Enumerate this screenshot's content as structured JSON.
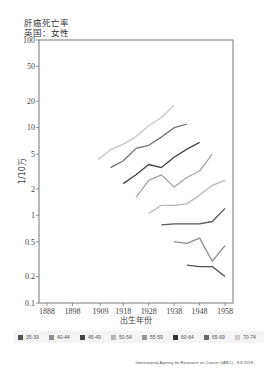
{
  "title": {
    "line1": "肝癌死亡率",
    "line2": "英国：女性"
  },
  "credit": "International Agency for Research on Cancer (IARC) - 9.8.2018",
  "chart_data": {
    "type": "line",
    "title": "肝癌死亡率 英国：女性",
    "xlabel": "出生年份",
    "ylabel": "1/10万",
    "yscale": "log",
    "ylim": [
      0.1,
      100
    ],
    "y_ticks": [
      100,
      50,
      20,
      10,
      5,
      2,
      1,
      0.5,
      0.2,
      0.1
    ],
    "x_ticks": [
      "1888",
      "1898",
      "1909",
      "1918",
      "1928",
      "1938",
      "1948",
      "1958"
    ],
    "legend_position": "bottom",
    "grid": false,
    "series": [
      {
        "name": "70-74",
        "color": "#c8c8c8",
        "x": [
          1908,
          1913,
          1918,
          1923,
          1928,
          1933,
          1938
        ],
        "values": [
          4.3,
          5.6,
          6.5,
          7.9,
          10.5,
          13.0,
          18.0
        ]
      },
      {
        "name": "65-69",
        "color": "#6e6e6e",
        "x": [
          1913,
          1918,
          1923,
          1928,
          1933,
          1938,
          1943
        ],
        "values": [
          3.5,
          4.2,
          5.8,
          6.3,
          7.8,
          10.0,
          11.0
        ]
      },
      {
        "name": "60-64",
        "color": "#444444",
        "x": [
          1918,
          1923,
          1928,
          1933,
          1938,
          1943,
          1948
        ],
        "values": [
          2.3,
          2.9,
          3.8,
          3.5,
          4.6,
          5.7,
          6.8
        ]
      },
      {
        "name": "55-59",
        "color": "#a5a5a5",
        "x": [
          1923,
          1928,
          1933,
          1938,
          1943,
          1948,
          1953
        ],
        "values": [
          1.6,
          2.5,
          2.9,
          2.1,
          2.7,
          3.2,
          5.0
        ]
      },
      {
        "name": "50-54",
        "color": "#b8b8b8",
        "x": [
          1928,
          1933,
          1938,
          1943,
          1948,
          1953,
          1958
        ],
        "values": [
          1.05,
          1.3,
          1.3,
          1.35,
          1.7,
          2.2,
          2.5
        ]
      },
      {
        "name": "45-49",
        "color": "#555555",
        "x": [
          1933,
          1938,
          1943,
          1948,
          1953,
          1958
        ],
        "values": [
          0.78,
          0.8,
          0.8,
          0.8,
          0.85,
          1.2
        ]
      },
      {
        "name": "40-44",
        "color": "#8c8c8c",
        "x": [
          1938,
          1943,
          1948,
          1953,
          1958
        ],
        "values": [
          0.5,
          0.48,
          0.55,
          0.3,
          0.45
        ]
      },
      {
        "name": "35-39",
        "color": "#505050",
        "x": [
          1943,
          1948,
          1953,
          1958
        ],
        "values": [
          0.27,
          0.26,
          0.26,
          0.2
        ]
      }
    ]
  },
  "legend": [
    {
      "label": "35-39",
      "color": "#555555"
    },
    {
      "label": "40-44",
      "color": "#909090"
    },
    {
      "label": "45-49",
      "color": "#444444"
    },
    {
      "label": "50-54",
      "color": "#b5b5b5"
    },
    {
      "label": "55-59",
      "color": "#999999"
    },
    {
      "label": "60-64",
      "color": "#333333"
    },
    {
      "label": "65-69",
      "color": "#666666"
    },
    {
      "label": "70-74",
      "color": "#cfcfcf"
    }
  ]
}
